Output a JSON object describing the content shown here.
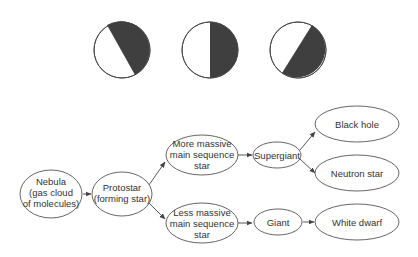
{
  "moon_phases": [
    {
      "id": "phase-1",
      "description": "circle with dark right portion, diagonal boundary leaning right",
      "dark_color": "#3f3f3f"
    },
    {
      "id": "phase-2",
      "description": "circle with right half dark, vertical boundary",
      "dark_color": "#3f3f3f"
    },
    {
      "id": "phase-3",
      "description": "circle with dark right portion, diagonal boundary leaning left",
      "dark_color": "#3f3f3f"
    }
  ],
  "flowchart": {
    "nodes": {
      "nebula": [
        "Nebula",
        "(gas cloud",
        "of molecules)"
      ],
      "protostar": [
        "Protostar",
        "(forming star)"
      ],
      "more_massive": [
        "More massive",
        "main sequence",
        "star"
      ],
      "less_massive": [
        "Less massive",
        "main sequence",
        "star"
      ],
      "supergiant": [
        "Supergiant"
      ],
      "giant": [
        "Giant"
      ],
      "black_hole": [
        "Black hole"
      ],
      "neutron_star": [
        "Neutron star"
      ],
      "white_dwarf": [
        "White dwarf"
      ]
    },
    "edges": [
      [
        "nebula",
        "protostar"
      ],
      [
        "protostar",
        "more_massive"
      ],
      [
        "protostar",
        "less_massive"
      ],
      [
        "more_massive",
        "supergiant"
      ],
      [
        "supergiant",
        "black_hole"
      ],
      [
        "supergiant",
        "neutron_star"
      ],
      [
        "less_massive",
        "giant"
      ],
      [
        "giant",
        "white_dwarf"
      ]
    ]
  }
}
